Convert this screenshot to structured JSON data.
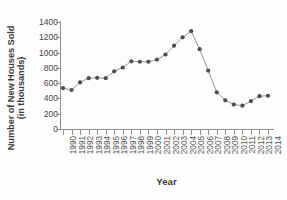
{
  "chart_data": {
    "type": "line",
    "title": "",
    "xlabel": "Year",
    "ylabel": "Number of New Houses Sold (in thousands)",
    "ylabel_line1": "Number of New Houses Sold",
    "ylabel_line2": "(in thousands)",
    "ylim": [
      0,
      1400
    ],
    "xlim": [
      1990,
      2014
    ],
    "ytick_labels": [
      "0",
      "200",
      "400",
      "600",
      "800",
      "1000",
      "1200",
      "1400"
    ],
    "ytick_values": [
      0,
      200,
      400,
      600,
      800,
      1000,
      1200,
      1400
    ],
    "grid": false,
    "legend": false,
    "legend_position": "none",
    "marker": "circle",
    "marker_color": "#4d4d4d",
    "line_color": "#8a8a8a",
    "axis_color": "#8e8e8e",
    "background_color": "#fdfdfd",
    "categories": [
      "1990",
      "1991",
      "1992",
      "1993",
      "1994",
      "1995",
      "1996",
      "1997",
      "1998",
      "1999",
      "2000",
      "2001",
      "2002",
      "2003",
      "2004",
      "2005",
      "2006",
      "2007",
      "2008",
      "2009",
      "2010",
      "2011",
      "2012",
      "2013",
      "2014"
    ],
    "x": [
      1990,
      1991,
      1992,
      1993,
      1994,
      1995,
      1996,
      1997,
      1998,
      1999,
      2000,
      2001,
      2002,
      2003,
      2004,
      2005,
      2006,
      2007,
      2008,
      2009,
      2010,
      2011,
      2012,
      2013,
      2014
    ],
    "values": [
      535,
      510,
      610,
      665,
      670,
      665,
      755,
      805,
      885,
      880,
      880,
      908,
      975,
      1090,
      1200,
      1280,
      1045,
      765,
      480,
      375,
      320,
      305,
      365,
      430,
      435
    ]
  }
}
